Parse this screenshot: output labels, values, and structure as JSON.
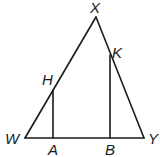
{
  "diagram": {
    "type": "geometry-triangle",
    "points": {
      "X": {
        "label": "X",
        "x": 96,
        "y": 17
      },
      "W": {
        "label": "W",
        "x": 25,
        "y": 138
      },
      "Y": {
        "label": "Y",
        "x": 144,
        "y": 138
      },
      "H": {
        "label": "H",
        "x": 53,
        "y": 90
      },
      "K": {
        "label": "K",
        "x": 110,
        "y": 55
      },
      "A": {
        "label": "A",
        "x": 53,
        "y": 138
      },
      "B": {
        "label": "B",
        "x": 110,
        "y": 138
      }
    },
    "segments": [
      "WX",
      "XY",
      "WY",
      "HA",
      "KB"
    ],
    "stroke_color": "#1a1a1a",
    "background": "#ffffff"
  }
}
